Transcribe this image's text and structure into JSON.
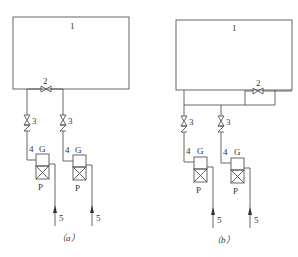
{
  "figure": {
    "panels": [
      {
        "id": "a",
        "caption": "（a）",
        "tank_label": "1",
        "bypass_valve_label": "2",
        "units": [
          {
            "valve_label": "3",
            "pipe_label": "4",
            "gas_label": "G",
            "pump_label": "P",
            "inlet_label": "5"
          },
          {
            "valve_label": "3",
            "pipe_label": "4",
            "gas_label": "G",
            "pump_label": "P",
            "inlet_label": "5"
          }
        ]
      },
      {
        "id": "b",
        "caption": "（b）",
        "tank_label": "1",
        "bypass_valve_label": "2",
        "units": [
          {
            "valve_label": "3",
            "pipe_label": "4",
            "gas_label": "G",
            "pump_label": "P",
            "inlet_label": "5"
          },
          {
            "valve_label": "3",
            "pipe_label": "4",
            "gas_label": "G",
            "pump_label": "P",
            "inlet_label": "5"
          }
        ]
      }
    ],
    "colors": {
      "line": "#555555",
      "text": "#333333",
      "background": "#ffffff"
    }
  }
}
